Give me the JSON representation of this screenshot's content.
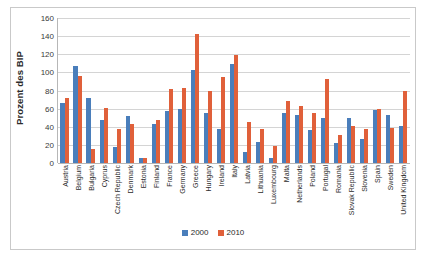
{
  "chart_data": {
    "type": "bar",
    "title": "",
    "xlabel": "",
    "ylabel": "Prozent des BIP",
    "ylim": [
      0,
      160
    ],
    "ytick_step": 20,
    "yticks": [
      160,
      140,
      120,
      100,
      80,
      60,
      40,
      20,
      0
    ],
    "grid": true,
    "legend_position": "bottom",
    "colors": {
      "2000": "#4a7ebb",
      "2010": "#e0603a"
    },
    "categories": [
      "Austria",
      "Belgium",
      "Bulgaria",
      "Cyprus",
      "Czech Republic",
      "Denmark",
      "Estonia",
      "Finland",
      "France",
      "Germany",
      "Greece",
      "Hungary",
      "Ireland",
      "Italy",
      "Latvia",
      "Lithuania",
      "Luxembourg",
      "Malta",
      "Netherlands",
      "Poland",
      "Portugal",
      "Romania",
      "Slovak Republic",
      "Slovenia",
      "Spain",
      "Sweden",
      "United Kingdom"
    ],
    "series": [
      {
        "name": "2000",
        "values": [
          66,
          107,
          72,
          48,
          18,
          52,
          5,
          43,
          57,
          60,
          103,
          55,
          37,
          109,
          12,
          23,
          6,
          55,
          53,
          36,
          50,
          22,
          50,
          26,
          59,
          53,
          41
        ]
      },
      {
        "name": "2010",
        "values": [
          72,
          96,
          16,
          61,
          38,
          43,
          6,
          48,
          82,
          83,
          142,
          80,
          95,
          119,
          45,
          38,
          19,
          68,
          63,
          55,
          93,
          31,
          41,
          38,
          60,
          39,
          80
        ]
      }
    ]
  },
  "legend": {
    "items": [
      {
        "label": "2000",
        "color": "#4a7ebb"
      },
      {
        "label": "2010",
        "color": "#e0603a"
      }
    ]
  }
}
